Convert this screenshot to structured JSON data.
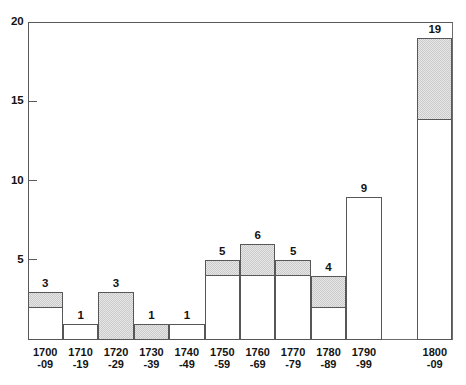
{
  "chart_data": {
    "type": "bar",
    "title": "",
    "subtitle": "",
    "xlabel": "",
    "ylabel": "",
    "grid": false,
    "legend_position": "none",
    "axis": {
      "x_range_px": [
        27,
        452
      ],
      "ylim": [
        0,
        20
      ],
      "y_ticks": [
        0,
        5,
        10,
        15,
        20
      ],
      "y_tick_labels": [
        "",
        "5",
        "10",
        "15",
        "20"
      ],
      "y_axis_labels_shown": [
        "5",
        "10",
        "15",
        "20"
      ]
    },
    "bin_count": 12,
    "categories": [
      "1700\n-09",
      "1710\n-19",
      "1720\n-29",
      "1730\n-39",
      "1740\n-49",
      "1750\n-59",
      "1760\n-69",
      "1770\n-79",
      "1780\n-89",
      "1790\n-99",
      "",
      "1800\n-09"
    ],
    "values": [
      3,
      1,
      3,
      1,
      1,
      5,
      6,
      5,
      4,
      9,
      0,
      19
    ],
    "value_labels": [
      "3",
      "1",
      "3",
      "1",
      "1",
      "5",
      "6",
      "5",
      "4",
      "9",
      "",
      "19"
    ],
    "series": [
      {
        "name": "shaded (hatched) portion",
        "description": "upper hatched sub-portion of each bar",
        "base_values": [
          2,
          1,
          0,
          0,
          1,
          4,
          4,
          4,
          2,
          9,
          0,
          13.8
        ],
        "top_values": [
          3,
          1,
          3,
          1,
          1,
          5,
          6,
          5,
          4,
          9,
          0,
          19
        ]
      },
      {
        "name": "unshaded (white) portion",
        "description": "lower white sub-portion of each bar",
        "base_values": [
          0,
          0,
          0,
          0,
          0,
          0,
          0,
          0,
          0,
          0,
          0,
          0
        ],
        "top_values": [
          2,
          1,
          0,
          0,
          1,
          4,
          4,
          4,
          2,
          9,
          0,
          13.8
        ]
      }
    ],
    "colors": {
      "bar_outline": "#57575a",
      "bar_fill_shaded": "#dcdcdc",
      "bar_fill_plain": "#ffffff",
      "axis": "#59595b",
      "text": "#131313",
      "background": "#ffffff"
    }
  },
  "x_axis": {
    "labels": [
      {
        "top": "1700",
        "bottom": "-09"
      },
      {
        "top": "1710",
        "bottom": "-19"
      },
      {
        "top": "1720",
        "bottom": "-29"
      },
      {
        "top": "1730",
        "bottom": "-39"
      },
      {
        "top": "1740",
        "bottom": "-49"
      },
      {
        "top": "1750",
        "bottom": "-59"
      },
      {
        "top": "1760",
        "bottom": "-69"
      },
      {
        "top": "1770",
        "bottom": "-79"
      },
      {
        "top": "1780",
        "bottom": "-89"
      },
      {
        "top": "1790",
        "bottom": "-99"
      },
      {
        "top": "",
        "bottom": ""
      },
      {
        "top": "1800",
        "bottom": "-09"
      }
    ]
  },
  "y_axis": {
    "ticks": [
      {
        "label": "20",
        "value": 20
      },
      {
        "label": "15",
        "value": 15
      },
      {
        "label": "10",
        "value": 10
      },
      {
        "label": "5",
        "value": 5
      }
    ]
  }
}
